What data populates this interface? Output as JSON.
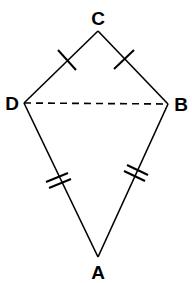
{
  "diagram": {
    "type": "kite",
    "vertices": {
      "C": {
        "label": "C",
        "x": 98,
        "y": 31,
        "label_x": 98,
        "label_y": 25
      },
      "D": {
        "label": "D",
        "x": 24,
        "y": 103,
        "label_x": 12,
        "label_y": 110
      },
      "B": {
        "label": "B",
        "x": 168,
        "y": 104,
        "label_x": 181,
        "label_y": 111
      },
      "A": {
        "label": "A",
        "x": 98,
        "y": 257,
        "label_x": 98,
        "label_y": 279
      }
    },
    "sides": [
      {
        "from": "C",
        "to": "D",
        "style": "solid",
        "tick_marks": 1
      },
      {
        "from": "C",
        "to": "B",
        "style": "solid",
        "tick_marks": 1
      },
      {
        "from": "D",
        "to": "A",
        "style": "solid",
        "tick_marks": 2
      },
      {
        "from": "B",
        "to": "A",
        "style": "solid",
        "tick_marks": 2
      }
    ],
    "diagonals": [
      {
        "from": "D",
        "to": "B",
        "style": "dashed"
      }
    ],
    "colors": {
      "stroke": "#000000",
      "background": "#ffffff"
    }
  }
}
